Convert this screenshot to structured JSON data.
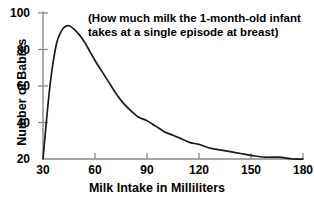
{
  "chart_data": {
    "type": "line",
    "title": "",
    "annotation": [
      "(How much milk the 1-month-old infant",
      "takes at a single episode at breast)"
    ],
    "annotation_text": "(How much milk the 1-month-old infant takes at a single episode at breast)",
    "xlabel": "Milk Intake in Milliliters",
    "ylabel": "Number of Babies",
    "xlim": [
      30,
      180
    ],
    "ylim": [
      20,
      100
    ],
    "xticks": [
      30,
      60,
      90,
      120,
      150,
      180
    ],
    "yticks": [
      20,
      40,
      60,
      80,
      100
    ],
    "xtick_labels": [
      "30",
      "60",
      "90",
      "120",
      "150",
      "180"
    ],
    "ytick_labels": [
      "20",
      "40",
      "60",
      "80",
      "100"
    ],
    "grid": false,
    "legend": false,
    "line_color": "#1a1a1a",
    "axis_color": "#808080",
    "background": "#ffffff",
    "series": [
      {
        "name": "Number of Babies",
        "x": [
          30,
          32,
          34,
          36,
          38,
          40,
          42,
          45,
          48,
          51,
          54,
          57,
          60,
          64,
          68,
          72,
          76,
          80,
          85,
          90,
          95,
          100,
          105,
          110,
          115,
          120,
          126,
          132,
          138,
          144,
          150,
          158,
          166,
          174,
          180
        ],
        "values": [
          20,
          41,
          60,
          74,
          84,
          89,
          92,
          93,
          91,
          88,
          84,
          79,
          74,
          68,
          62,
          56,
          51,
          47,
          43,
          41,
          38,
          35,
          33,
          31,
          29,
          28,
          26,
          25,
          24,
          23,
          22,
          21,
          21,
          20,
          20
        ]
      }
    ]
  },
  "axes": {
    "x_title": "Milk Intake in Milliliters",
    "y_title": "Number of Babies",
    "x_tick_labels": [
      "30",
      "60",
      "90",
      "120",
      "150",
      "180"
    ],
    "y_tick_labels": [
      "20",
      "40",
      "60",
      "80",
      "100"
    ]
  },
  "annotation": {
    "line1": "(How much milk the 1-month-old infant",
    "line2": "takes at a single episode at breast)"
  }
}
